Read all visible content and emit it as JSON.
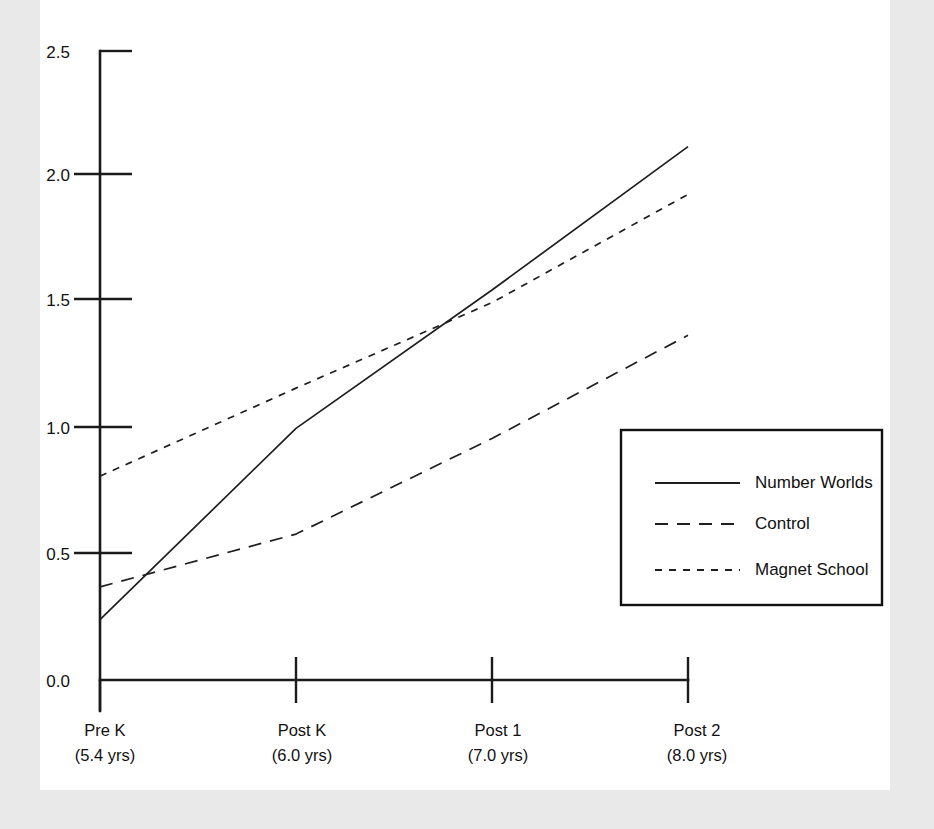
{
  "chart_data": {
    "type": "line",
    "title": "",
    "subtitle": "",
    "xlabel": "",
    "ylabel": "",
    "grid": false,
    "legend_position": "inside-right",
    "categories": [
      "Pre K",
      "Post K",
      "Post 1",
      "Post 2"
    ],
    "category_sublabels": [
      "(5.4 yrs)",
      "(6.0 yrs)",
      "(7.0 yrs)",
      "(8.0 yrs)"
    ],
    "x_ages": [
      5.4,
      6.0,
      7.0,
      8.0
    ],
    "ylim": [
      0.0,
      2.5
    ],
    "ytick_labels": [
      "0.0",
      "0.5",
      "1.0",
      "1.5",
      "2.0",
      "2.5"
    ],
    "ytick_values": [
      0.0,
      0.5,
      1.0,
      1.5,
      2.0,
      2.5
    ],
    "series": [
      {
        "name": "Number Worlds",
        "style": "solid",
        "values": [
          0.24,
          1.0,
          1.55,
          2.12
        ]
      },
      {
        "name": "Control",
        "style": "long-dash",
        "values": [
          0.37,
          0.58,
          0.96,
          1.37
        ]
      },
      {
        "name": "Magnet School",
        "style": "short-dash",
        "values": [
          0.81,
          1.16,
          1.5,
          1.93
        ]
      }
    ]
  },
  "legend": {
    "entries": [
      {
        "label": "Number Worlds",
        "style": "solid"
      },
      {
        "label": "Control",
        "style": "long-dash"
      },
      {
        "label": "Magnet School",
        "style": "short-dash"
      }
    ]
  },
  "colors": {
    "background": "#e9e9e9",
    "plot_background": "#ffffff",
    "ink": "#1a1a1a",
    "series_ink": "#1e1e1e"
  }
}
